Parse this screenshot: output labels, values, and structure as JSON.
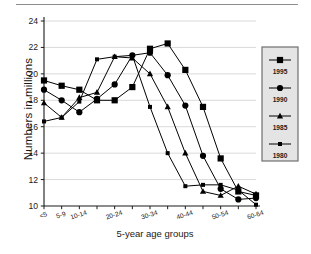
{
  "figure": {
    "name": "population-by-age-group-chart",
    "has_top_rule": true
  },
  "chart_data": {
    "type": "line",
    "title": "",
    "subtitle": "",
    "xlabel": "5-year age groups",
    "ylabel": "Numbers in millions",
    "categories": [
      "<5",
      "5-9",
      "10-14",
      "15-19",
      "20-24",
      "25-29",
      "30-34",
      "35-39",
      "40-44",
      "45-49",
      "50-54",
      "55-59",
      "60-64"
    ],
    "visible_tick_labels": [
      "<5",
      "5-9",
      "10-14",
      "",
      "20-24",
      "",
      "30-34",
      "",
      "40-44",
      "",
      "50-54",
      "",
      "60-64"
    ],
    "ylim": [
      10,
      24
    ],
    "yticks": [
      10,
      12,
      14,
      16,
      18,
      20,
      22,
      24
    ],
    "ytick_labels": [
      "10",
      "12",
      "14",
      "16",
      "18",
      "20",
      "22",
      "24"
    ],
    "grid": true,
    "grid_axis": "y",
    "legend_position": "right",
    "series": [
      {
        "name": "1995",
        "marker": "square",
        "color": "#000000",
        "values": [
          19.5,
          19.1,
          18.8,
          18.0,
          18.0,
          19.0,
          21.9,
          22.3,
          20.3,
          17.5,
          13.6,
          11.1,
          10.8
        ]
      },
      {
        "name": "1990",
        "marker": "circle",
        "color": "#000000",
        "values": [
          18.8,
          18.0,
          17.1,
          18.1,
          19.2,
          21.4,
          21.6,
          19.9,
          17.6,
          13.8,
          11.3,
          10.5,
          10.6
        ]
      },
      {
        "name": "1985",
        "marker": "triangle",
        "color": "#000000",
        "values": [
          17.8,
          16.7,
          18.2,
          18.6,
          21.3,
          21.2,
          20.0,
          17.5,
          14.0,
          11.1,
          10.8,
          11.5,
          10.9
        ]
      },
      {
        "name": "1980",
        "marker": "small-square",
        "color": "#000000",
        "values": [
          16.4,
          16.7,
          17.9,
          21.1,
          21.3,
          21.4,
          17.5,
          14.0,
          11.5,
          11.6,
          11.6,
          11.2,
          10.1
        ]
      }
    ]
  },
  "legend": {
    "entries": [
      {
        "label": "1995",
        "marker": "square"
      },
      {
        "label": "1990",
        "marker": "circle"
      },
      {
        "label": "1985",
        "marker": "triangle"
      },
      {
        "label": "1980",
        "marker": "small-square"
      }
    ]
  },
  "colors": {
    "line": "#000000",
    "axis": "#1a1a1a",
    "grid": "#c8c8c8",
    "legend_bg": "#e4e4e4",
    "legend_border": "#6e6e6e",
    "rule": "#8c8c8c"
  }
}
